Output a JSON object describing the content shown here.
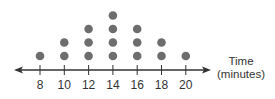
{
  "chart_data": {
    "type": "dot_plot",
    "title": "",
    "xlabel": "Time (minutes)",
    "xlabel_lines": [
      "Time",
      "(minutes)"
    ],
    "ylabel": "",
    "categories": [
      8,
      10,
      12,
      14,
      16,
      18,
      20
    ],
    "values": [
      1,
      2,
      3,
      4,
      3,
      2,
      1
    ],
    "tick_labels": [
      "8",
      "10",
      "12",
      "14",
      "16",
      "18",
      "20"
    ],
    "xlim": [
      8,
      20
    ],
    "grid": false,
    "legend": null,
    "axis_arrows": "both"
  },
  "colors": {
    "dot": "#6d6d6d",
    "axis": "#333333",
    "text": "#333333"
  }
}
